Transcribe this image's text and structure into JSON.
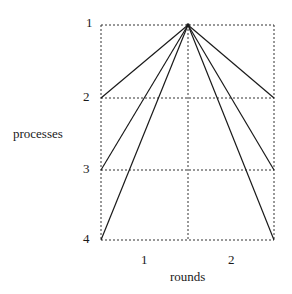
{
  "diagram": {
    "y_axis_label": "processes",
    "x_axis_label": "rounds",
    "process_labels": [
      "1",
      "2",
      "3",
      "4"
    ],
    "round_labels": [
      "1",
      "2"
    ],
    "grid": {
      "left": 101,
      "right": 274,
      "mid": 188,
      "rows_y": [
        25,
        98,
        170,
        240
      ]
    },
    "line_color": "#1a1a1a",
    "grid_color": "#333333"
  }
}
